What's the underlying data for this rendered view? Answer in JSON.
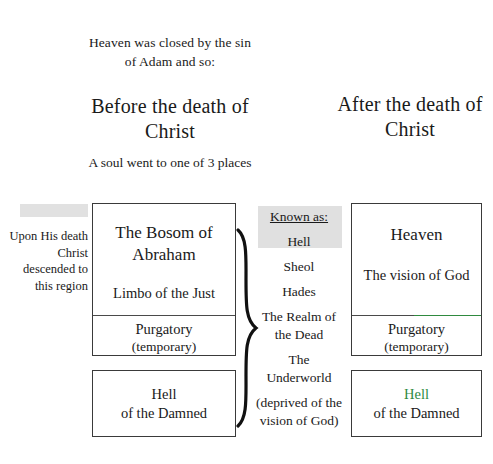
{
  "diagram": {
    "intro": "Heaven was closed by the sin of Adam and so:",
    "column_before": {
      "title": "Before the death of Christ",
      "subnote": "A soul went to one of 3 places",
      "side_caption": "Upon His death Christ descended to this region",
      "boxes": [
        {
          "name": "bosom-of-abraham",
          "line1": "The Bosom of Abraham",
          "line2": "Limbo of the Just",
          "lower1": "Purgatory",
          "lower2": "(temporary)"
        },
        {
          "name": "hell-of-the-damned",
          "line1": "Hell",
          "line2": "of the Damned"
        }
      ]
    },
    "known_as": {
      "heading": "Known as:",
      "items": [
        "Hell",
        "Sheol",
        "Hades",
        "The Realm of the Dead",
        "The Underworld",
        "(deprived of the vision of God)"
      ]
    },
    "column_after": {
      "title": "After the death of Christ",
      "boxes": [
        {
          "name": "heaven",
          "line1": "Heaven",
          "line2": "The vision of God",
          "lower1": "Purgatory",
          "lower2": "(temporary)"
        },
        {
          "name": "hell-of-the-damned",
          "line1": "Hell",
          "line2": "of the Damned"
        }
      ]
    },
    "colors": {
      "ink": "#1a1a1a",
      "box_border": "#3a3a3a",
      "highlight": "#dcdcdc",
      "green_line": "#2f8a3f"
    }
  }
}
